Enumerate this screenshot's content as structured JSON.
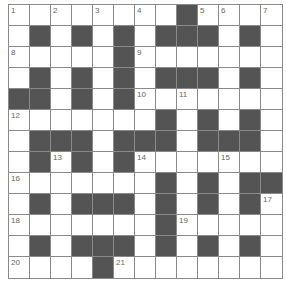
{
  "puzzle": {
    "rows": 13,
    "cols": 13,
    "colors": {
      "white": "#ffffff",
      "black": "#545454",
      "border": "#8a8a8a",
      "number": "#666666"
    },
    "layout": [
      "........#....",
      ".#.#.#.###.#.",
      ".....#.......",
      ".#.#.#.###.#.",
      "##.#.#.......",
      ".......#.#.#.",
      ".###.###.###.",
      ".#.#.#.......",
      ".......#.#.##",
      ".#.###.#.#.#.",
      ".......#.....",
      ".#.###.#.#.#.",
      "....#........"
    ],
    "numbers": [
      {
        "r": 0,
        "c": 0,
        "n": "1"
      },
      {
        "r": 0,
        "c": 2,
        "n": "2"
      },
      {
        "r": 0,
        "c": 4,
        "n": "3"
      },
      {
        "r": 0,
        "c": 6,
        "n": "4"
      },
      {
        "r": 0,
        "c": 9,
        "n": "5"
      },
      {
        "r": 0,
        "c": 10,
        "n": "6"
      },
      {
        "r": 0,
        "c": 12,
        "n": "7"
      },
      {
        "r": 2,
        "c": 0,
        "n": "8"
      },
      {
        "r": 2,
        "c": 6,
        "n": "9"
      },
      {
        "r": 4,
        "c": 6,
        "n": "10"
      },
      {
        "r": 4,
        "c": 8,
        "n": "11"
      },
      {
        "r": 5,
        "c": 0,
        "n": "12"
      },
      {
        "r": 7,
        "c": 2,
        "n": "13"
      },
      {
        "r": 7,
        "c": 6,
        "n": "14"
      },
      {
        "r": 7,
        "c": 10,
        "n": "15"
      },
      {
        "r": 8,
        "c": 0,
        "n": "16"
      },
      {
        "r": 9,
        "c": 12,
        "n": "17"
      },
      {
        "r": 10,
        "c": 0,
        "n": "18"
      },
      {
        "r": 10,
        "c": 8,
        "n": "19"
      },
      {
        "r": 12,
        "c": 0,
        "n": "20"
      },
      {
        "r": 12,
        "c": 5,
        "n": "21"
      }
    ]
  }
}
